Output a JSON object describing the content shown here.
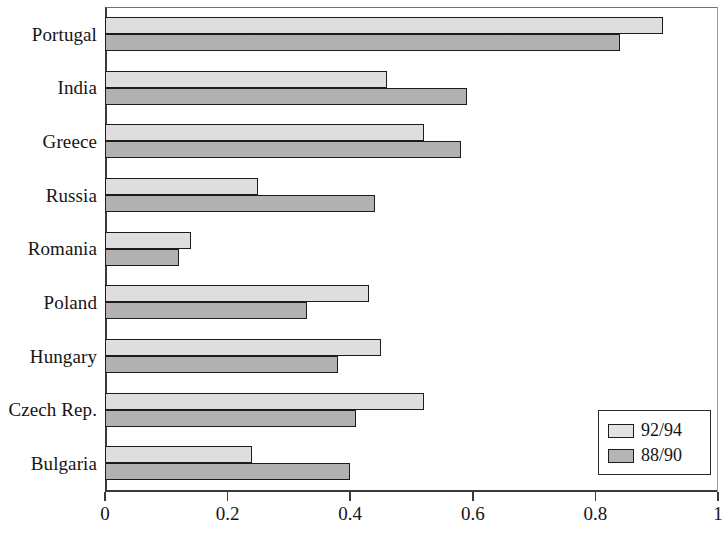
{
  "chart_data": {
    "type": "bar",
    "orientation": "horizontal",
    "title": "",
    "subtitle": "",
    "xlabel": "",
    "ylabel": "",
    "xlim": [
      0,
      1
    ],
    "ylim": null,
    "grid": false,
    "legend_position": "bottom-right",
    "xticks": [
      "0",
      "0.2",
      "0.4",
      "0.6",
      "0.8",
      "1"
    ],
    "xtick_values": [
      0,
      0.2,
      0.4,
      0.6,
      0.8,
      1
    ],
    "categories": [
      "Portugal",
      "India",
      "Greece",
      "Russia",
      "Romania",
      "Poland",
      "Hungary",
      "Czech Rep.",
      "Bulgaria"
    ],
    "series": [
      {
        "name": "92/94",
        "color": "#e2e2e2",
        "values": [
          0.91,
          0.46,
          0.52,
          0.25,
          0.14,
          0.43,
          0.45,
          0.52,
          0.24
        ]
      },
      {
        "name": "88/90",
        "color": "#b5b5b5",
        "values": [
          0.84,
          0.59,
          0.58,
          0.44,
          0.12,
          0.33,
          0.38,
          0.41,
          0.4
        ]
      }
    ]
  },
  "legend": {
    "items": [
      {
        "label": "92/94",
        "swatch": "light"
      },
      {
        "label": "88/90",
        "swatch": "dark"
      }
    ]
  },
  "colors": {
    "series_light": "#e2e2e2",
    "series_dark": "#b5b5b5",
    "bar_border": "#1c1c1c",
    "axis": "#3a3a3a",
    "text": "#151515",
    "background": "#ffffff"
  }
}
